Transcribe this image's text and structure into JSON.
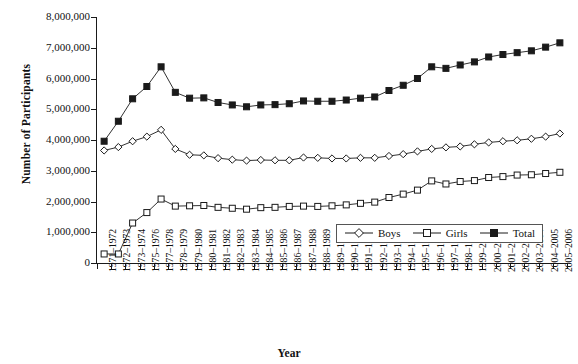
{
  "chart_data": {
    "type": "line",
    "title": "",
    "xlabel": "Year",
    "ylabel": "Number of Participants",
    "ylim": [
      0,
      8000000
    ],
    "ytick_step": 1000000,
    "grid": false,
    "legend_position": "inside-bottom-right",
    "ytick_labels": [
      "8,000,000",
      "7,000,000",
      "6,000,000",
      "5,000,000",
      "4,000,000",
      "3,000,000",
      "2,000,000",
      "1,000,000",
      "0"
    ],
    "categories": [
      "1971–1972",
      "1972–1973",
      "1973–1974",
      "1975–1976",
      "1977–1978",
      "1978–1979",
      "1979–1980",
      "1980–1981",
      "1981–1982",
      "1982–1983",
      "1983–1984",
      "1984–1985",
      "1985–1986",
      "1986–1987",
      "1987–1988",
      "1988–1989",
      "1989–1990",
      "1990–1991",
      "1991–1992",
      "1992–1993",
      "1993–1994",
      "1994–1995",
      "1995–1996",
      "1996–1997",
      "1997–1998",
      "1998–1999",
      "1999–2000",
      "2000–2001",
      "2001–2002",
      "2002–2003",
      "2003–2004",
      "2004–2005",
      "2005–2006"
    ],
    "series": [
      {
        "name": "Boys",
        "marker": "open-diamond",
        "color": "#1a1a1a",
        "values": [
          3660000,
          3770000,
          3960000,
          4110000,
          4330000,
          3710000,
          3520000,
          3500000,
          3410000,
          3360000,
          3330000,
          3350000,
          3340000,
          3340000,
          3430000,
          3420000,
          3400000,
          3400000,
          3420000,
          3420000,
          3480000,
          3540000,
          3630000,
          3710000,
          3760000,
          3790000,
          3860000,
          3920000,
          3960000,
          3990000,
          4040000,
          4110000,
          4210000
        ]
      },
      {
        "name": "Girls",
        "marker": "open-square",
        "color": "#1a1a1a",
        "values": [
          294000,
          294000,
          1300000,
          1640000,
          2080000,
          1850000,
          1860000,
          1870000,
          1810000,
          1780000,
          1750000,
          1800000,
          1810000,
          1840000,
          1850000,
          1840000,
          1860000,
          1890000,
          1940000,
          1980000,
          2130000,
          2240000,
          2370000,
          2670000,
          2570000,
          2650000,
          2680000,
          2780000,
          2810000,
          2860000,
          2870000,
          2910000,
          2950000
        ]
      },
      {
        "name": "Total",
        "marker": "filled-square",
        "color": "#1a1a1a",
        "values": [
          3960000,
          4610000,
          5340000,
          5740000,
          6380000,
          5550000,
          5360000,
          5370000,
          5220000,
          5140000,
          5080000,
          5140000,
          5150000,
          5180000,
          5270000,
          5260000,
          5260000,
          5300000,
          5360000,
          5400000,
          5610000,
          5780000,
          6000000,
          6380000,
          6330000,
          6440000,
          6540000,
          6700000,
          6780000,
          6840000,
          6900000,
          7020000,
          7160000
        ]
      }
    ]
  }
}
